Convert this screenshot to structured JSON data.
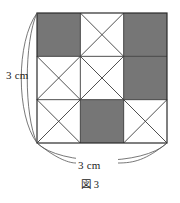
{
  "figure": {
    "caption": "図 3",
    "caption_reading": "Figure 3",
    "dimensions": {
      "height_label": "3 cm",
      "width_label": "3 cm"
    },
    "colors": {
      "shade_fill": "#767676",
      "line_stroke": "#3c3c3c",
      "border_stroke": "#2b2b2b",
      "brace_stroke": "#555555",
      "background": "#ffffff",
      "text": "#1c1c1c"
    },
    "geometry": {
      "grid_rows": 3,
      "grid_cols": 3,
      "square_left": 37,
      "square_top": 13,
      "square_size": 130,
      "cell_size": 43.333
    },
    "grid": {
      "legend": {
        "shaded": "solid gray filled square",
        "crossed": "white square with both diagonals drawn (X)"
      },
      "cells": [
        [
          {
            "row": 0,
            "col": 0,
            "fill": "shaded",
            "diagonals": "none"
          },
          {
            "row": 0,
            "col": 1,
            "fill": "white",
            "diagonals": "both"
          },
          {
            "row": 0,
            "col": 2,
            "fill": "shaded",
            "diagonals": "none"
          }
        ],
        [
          {
            "row": 1,
            "col": 0,
            "fill": "white",
            "diagonals": "both"
          },
          {
            "row": 1,
            "col": 1,
            "fill": "white",
            "diagonals": "both"
          },
          {
            "row": 1,
            "col": 2,
            "fill": "shaded",
            "diagonals": "none"
          }
        ],
        [
          {
            "row": 2,
            "col": 0,
            "fill": "white",
            "diagonals": "both"
          },
          {
            "row": 2,
            "col": 1,
            "fill": "shaded",
            "diagonals": "none"
          },
          {
            "row": 2,
            "col": 2,
            "fill": "white",
            "diagonals": "both"
          }
        ]
      ]
    }
  }
}
